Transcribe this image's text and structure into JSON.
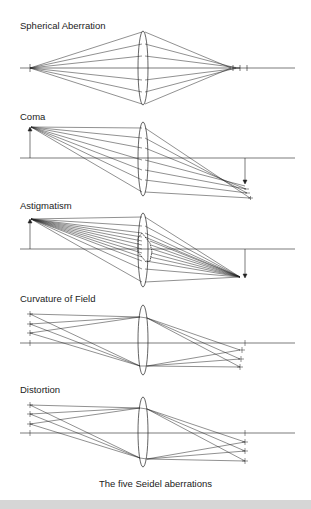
{
  "figure": {
    "caption": "The five Seidel aberrations",
    "stroke_color": "#222222",
    "background": "#ffffff",
    "bottom_band_color": "#d6d6d6"
  },
  "panels": [
    {
      "id": "spherical",
      "title": "Spherical Aberration",
      "label_y": 20,
      "axis_y": 68
    },
    {
      "id": "coma",
      "title": "Coma",
      "label_y": 111,
      "axis_y": 158
    },
    {
      "id": "astigmatism",
      "title": "Astigmatism",
      "label_y": 200,
      "axis_y": 249
    },
    {
      "id": "curvature",
      "title": "Curvature of Field",
      "label_y": 293,
      "axis_y": 343
    },
    {
      "id": "distortion",
      "title": "Distortion",
      "label_y": 384,
      "axis_y": 433
    }
  ]
}
